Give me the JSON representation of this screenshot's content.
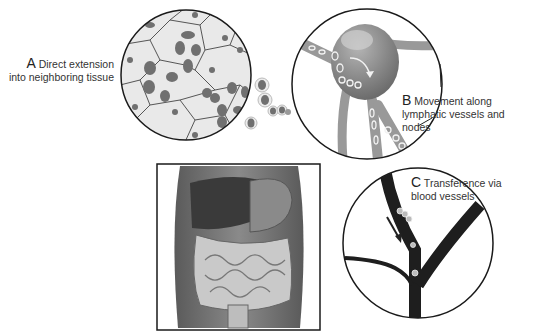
{
  "diagram": {
    "panels": [
      {
        "id": "A",
        "letter": "A",
        "line1": "Direct extension",
        "line2": "into neighboring tissue",
        "subject": "epithelial cells with invading tumor cells"
      },
      {
        "id": "B",
        "letter": "B",
        "line1": "Movement along",
        "line2": "lymphatic vessels and nodes",
        "subject": "lymph node with vessels carrying tumor cells"
      },
      {
        "id": "C",
        "letter": "C",
        "line1": "Transference via",
        "line2": "blood vessels",
        "subject": "branching blood vessel with tumor cells and flow arrow"
      }
    ],
    "center_image": {
      "subject": "human abdomen showing liver, stomach and intestines"
    },
    "colors": {
      "outline": "#1a1a1a",
      "cell_fill": "#e4e4e4",
      "nucleus": "#6e6e6e",
      "lymph": "#8c8c8c",
      "blood_vessel": "#1e1e1e",
      "body": "#7a7a7a"
    }
  }
}
